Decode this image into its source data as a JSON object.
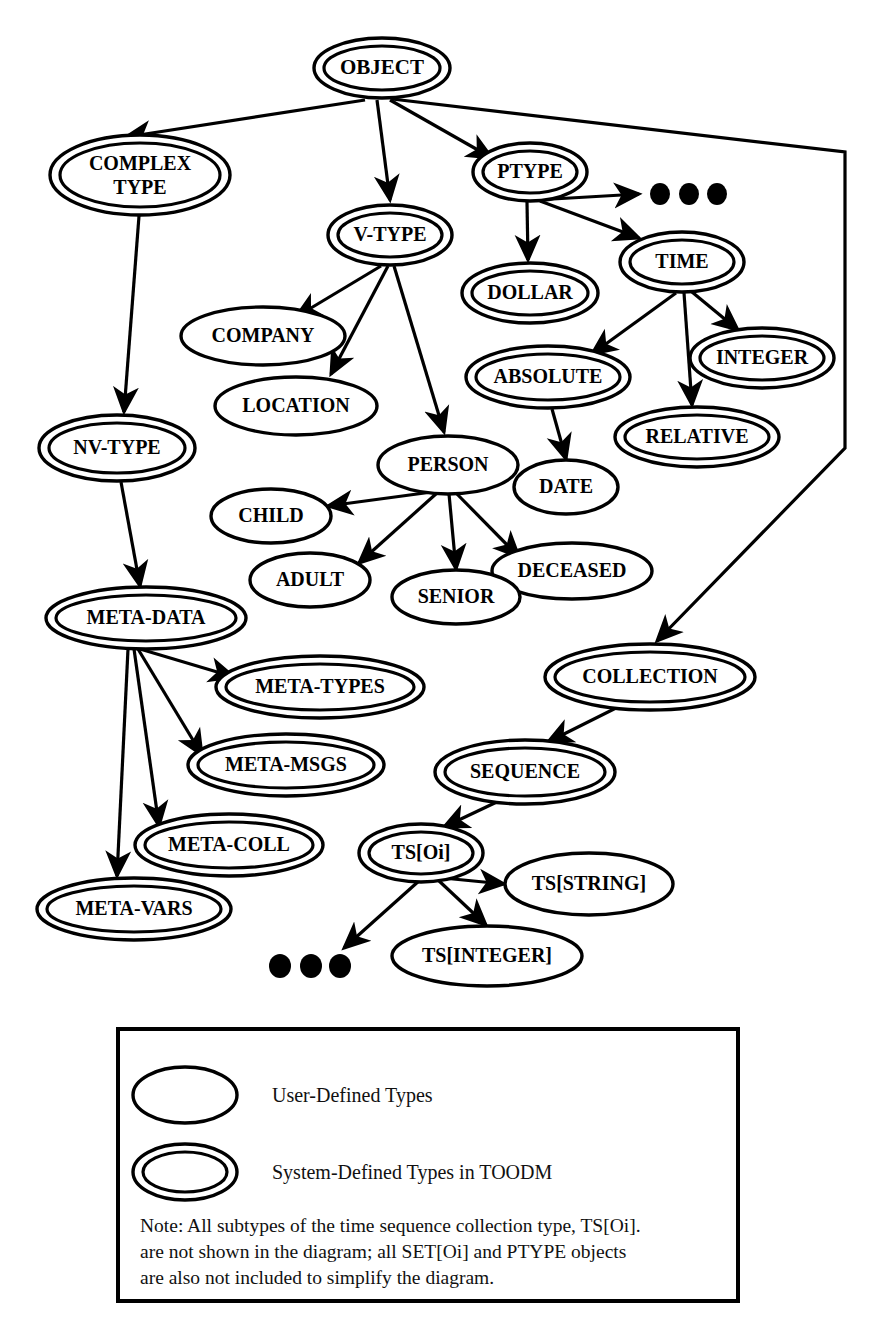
{
  "diagram": {
    "ink_color": "#000000",
    "background": "#ffffff",
    "nodes": [
      {
        "id": "OBJECT",
        "label": "OBJECT",
        "kind": "system",
        "cx": 382,
        "cy": 68,
        "rx": 68,
        "ry": 30,
        "font": 21
      },
      {
        "id": "COMPLEXTYPE",
        "label": "COMPLEX",
        "label2": "TYPE",
        "kind": "system",
        "cx": 140,
        "cy": 175,
        "rx": 90,
        "ry": 40,
        "font": 20
      },
      {
        "id": "PTYPE",
        "label": "PTYPE",
        "kind": "system",
        "cx": 530,
        "cy": 172,
        "rx": 57,
        "ry": 29,
        "font": 20
      },
      {
        "id": "VTYPE",
        "label": "V-TYPE",
        "kind": "system",
        "cx": 390,
        "cy": 235,
        "rx": 62,
        "ry": 30,
        "font": 20
      },
      {
        "id": "DOLLAR",
        "label": "DOLLAR",
        "kind": "system",
        "cx": 530,
        "cy": 293,
        "rx": 68,
        "ry": 30,
        "font": 20
      },
      {
        "id": "TIME",
        "label": "TIME",
        "kind": "system",
        "cx": 682,
        "cy": 262,
        "rx": 62,
        "ry": 30,
        "font": 20
      },
      {
        "id": "COMPANY",
        "label": "COMPANY",
        "kind": "user",
        "cx": 263,
        "cy": 336,
        "rx": 82,
        "ry": 29,
        "font": 20
      },
      {
        "id": "LOCATION",
        "label": "LOCATION",
        "kind": "user",
        "cx": 296,
        "cy": 406,
        "rx": 81,
        "ry": 29,
        "font": 20
      },
      {
        "id": "ABSOLUTE",
        "label": "ABSOLUTE",
        "kind": "system",
        "cx": 548,
        "cy": 377,
        "rx": 82,
        "ry": 31,
        "font": 20
      },
      {
        "id": "INTEGER",
        "label": "INTEGER",
        "kind": "system",
        "cx": 762,
        "cy": 358,
        "rx": 72,
        "ry": 30,
        "font": 20
      },
      {
        "id": "RELATIVE",
        "label": "RELATIVE",
        "kind": "system",
        "cx": 697,
        "cy": 437,
        "rx": 82,
        "ry": 30,
        "font": 20
      },
      {
        "id": "NVTYPE",
        "label": "NV-TYPE",
        "kind": "system",
        "cx": 117,
        "cy": 448,
        "rx": 78,
        "ry": 33,
        "font": 20
      },
      {
        "id": "PERSON",
        "label": "PERSON",
        "kind": "user",
        "cx": 448,
        "cy": 465,
        "rx": 70,
        "ry": 29,
        "font": 20
      },
      {
        "id": "DATE",
        "label": "DATE",
        "kind": "user",
        "cx": 566,
        "cy": 487,
        "rx": 52,
        "ry": 27,
        "font": 20
      },
      {
        "id": "CHILD",
        "label": "CHILD",
        "kind": "user",
        "cx": 271,
        "cy": 516,
        "rx": 60,
        "ry": 27,
        "font": 20
      },
      {
        "id": "ADULT",
        "label": "ADULT",
        "kind": "user",
        "cx": 310,
        "cy": 580,
        "rx": 60,
        "ry": 27,
        "font": 20
      },
      {
        "id": "DECEASED",
        "label": "DECEASED",
        "kind": "user",
        "cx": 572,
        "cy": 571,
        "rx": 80,
        "ry": 28,
        "font": 20
      },
      {
        "id": "SENIOR",
        "label": "SENIOR",
        "kind": "user",
        "cx": 456,
        "cy": 597,
        "rx": 64,
        "ry": 27,
        "font": 20
      },
      {
        "id": "METADATA",
        "label": "META-DATA",
        "kind": "system",
        "cx": 146,
        "cy": 618,
        "rx": 100,
        "ry": 31,
        "font": 20
      },
      {
        "id": "COLLECTION",
        "label": "COLLECTION",
        "kind": "system",
        "cx": 650,
        "cy": 677,
        "rx": 105,
        "ry": 33,
        "font": 20
      },
      {
        "id": "METATYPES",
        "label": "META-TYPES",
        "kind": "system",
        "cx": 320,
        "cy": 687,
        "rx": 104,
        "ry": 31,
        "font": 20
      },
      {
        "id": "SEQUENCE",
        "label": "SEQUENCE",
        "kind": "system",
        "cx": 525,
        "cy": 772,
        "rx": 90,
        "ry": 32,
        "font": 20
      },
      {
        "id": "METAMSGS",
        "label": "META-MSGS",
        "kind": "system",
        "cx": 286,
        "cy": 765,
        "rx": 98,
        "ry": 31,
        "font": 20
      },
      {
        "id": "METACOLL",
        "label": "META-COLL",
        "kind": "system",
        "cx": 229,
        "cy": 845,
        "rx": 94,
        "ry": 31,
        "font": 20
      },
      {
        "id": "TSOI",
        "label": "TS[Oi]",
        "kind": "system",
        "cx": 421,
        "cy": 853,
        "rx": 62,
        "ry": 29,
        "font": 20
      },
      {
        "id": "METAVARS",
        "label": "META-VARS",
        "kind": "system",
        "cx": 134,
        "cy": 909,
        "rx": 97,
        "ry": 31,
        "font": 20
      },
      {
        "id": "TSSTRING",
        "label": "TS[STRING]",
        "kind": "user",
        "cx": 589,
        "cy": 884,
        "rx": 84,
        "ry": 31,
        "font": 20
      },
      {
        "id": "TSINTEGER",
        "label": "TS[INTEGER]",
        "kind": "user",
        "cx": 487,
        "cy": 956,
        "rx": 95,
        "ry": 30,
        "font": 20
      }
    ],
    "edges": [
      {
        "from": "OBJECT",
        "to": "COMPLEXTYPE",
        "path": "M 365,100 L 126,137"
      },
      {
        "from": "OBJECT",
        "to": "VTYPE",
        "path": "M 377,100 L 390,200"
      },
      {
        "from": "OBJECT",
        "to": "PTYPE",
        "path": "M 390,100 L 492,158"
      },
      {
        "from": "OBJECT",
        "to": "COLLECTION",
        "path": "M 392,99 L 845,152 L 845,448 L 657,641"
      },
      {
        "from": "COMPLEXTYPE",
        "to": "NVTYPE",
        "path": "M 139,216 L 124,412"
      },
      {
        "from": "VTYPE",
        "to": "COMPANY",
        "path": "M 381,266 L 296,317"
      },
      {
        "from": "VTYPE",
        "to": "LOCATION",
        "path": "M 388,266 L 331,374"
      },
      {
        "from": "VTYPE",
        "to": "PERSON",
        "path": "M 394,266 L 444,432"
      },
      {
        "from": "PTYPE",
        "to": "DOLLAR",
        "path": "M 527,202 L 528,260"
      },
      {
        "from": "PTYPE",
        "to": "DOTS1",
        "path": "M 536,200 L 639,194"
      },
      {
        "from": "PTYPE",
        "to": "TIME",
        "path": "M 540,201 L 639,238"
      },
      {
        "from": "TIME",
        "to": "ABSOLUTE",
        "path": "M 676,293 L 592,354"
      },
      {
        "from": "TIME",
        "to": "RELATIVE",
        "path": "M 684,293 L 692,405"
      },
      {
        "from": "TIME",
        "to": "INTEGER",
        "path": "M 692,292 L 738,330"
      },
      {
        "from": "ABSOLUTE",
        "to": "DATE",
        "path": "M 552,409 L 566,459"
      },
      {
        "from": "PERSON",
        "to": "CHILD",
        "path": "M 432,492 L 328,506"
      },
      {
        "from": "PERSON",
        "to": "ADULT",
        "path": "M 437,493 L 359,563"
      },
      {
        "from": "PERSON",
        "to": "SENIOR",
        "path": "M 449,494 L 456,569"
      },
      {
        "from": "PERSON",
        "to": "DECEASED",
        "path": "M 456,493 L 519,557"
      },
      {
        "from": "NVTYPE",
        "to": "METADATA",
        "path": "M 121,482 L 140,586"
      },
      {
        "from": "METADATA",
        "to": "METATYPES",
        "path": "M 140,649 L 234,677"
      },
      {
        "from": "METADATA",
        "to": "METAMSGS",
        "path": "M 138,649 L 202,755"
      },
      {
        "from": "METADATA",
        "to": "METACOLL",
        "path": "M 134,649 L 159,826"
      },
      {
        "from": "METADATA",
        "to": "METAVARS",
        "path": "M 128,649 L 117,876"
      },
      {
        "from": "COLLECTION",
        "to": "SEQUENCE",
        "path": "M 620,706 L 548,742"
      },
      {
        "from": "SEQUENCE",
        "to": "TSOI",
        "path": "M 501,800 L 444,827"
      },
      {
        "from": "TSOI",
        "to": "TSSTRING",
        "path": "M 443,878 L 504,884"
      },
      {
        "from": "TSOI",
        "to": "TSINTEGER",
        "path": "M 437,879 L 486,925"
      },
      {
        "from": "TSOI",
        "to": "DOTS2",
        "path": "M 420,880 L 344,948"
      }
    ],
    "ellipsis_groups": [
      {
        "id": "DOTS1",
        "label": "ellipsis",
        "dots": [
          {
            "cx": 660,
            "cy": 194
          },
          {
            "cx": 689,
            "cy": 194
          },
          {
            "cx": 717,
            "cy": 194
          }
        ],
        "rx": 10,
        "ry": 11
      },
      {
        "id": "DOTS2",
        "label": "ellipsis",
        "dots": [
          {
            "cx": 280,
            "cy": 966
          },
          {
            "cx": 311,
            "cy": 966
          },
          {
            "cx": 340,
            "cy": 966
          }
        ],
        "rx": 11,
        "ry": 12
      }
    ]
  },
  "legend": {
    "box": {
      "x": 118,
      "y": 1029,
      "width": 620,
      "height": 272
    },
    "items": [
      {
        "id": "user-defined",
        "kind": "user",
        "label": "User-Defined Types"
      },
      {
        "id": "system-defined",
        "kind": "system",
        "label": "System-Defined Types in TOODM"
      }
    ],
    "note_lines": [
      "Note:  All subtypes of the time sequence collection type, TS[Oi].",
      "are not shown in the diagram; all SET[Oi] and PTYPE objects",
      "are also not included to simplify the diagram."
    ]
  }
}
